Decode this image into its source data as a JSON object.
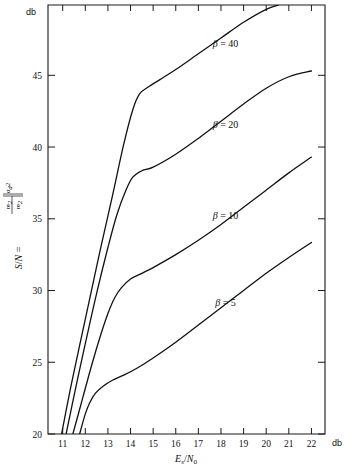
{
  "figure": {
    "x_unit_label": "db",
    "y_unit_label": "db",
    "x_axis_title_main": "E",
    "x_axis_title_sub1": "s",
    "x_axis_title_slash": "/",
    "x_axis_title_main2": "N",
    "x_axis_title_sub2": "0",
    "y_axis_title": "S/N = "
  },
  "chart_data": {
    "type": "line",
    "title": "",
    "xlabel": "E_s/N_0",
    "ylabel": "S/N",
    "x_unit": "db",
    "y_unit": "db",
    "xlim": [
      10.35,
      22.6
    ],
    "ylim": [
      20,
      49.9
    ],
    "xticks": [
      11,
      12,
      13,
      14,
      15,
      16,
      17,
      18,
      19,
      20,
      21,
      22
    ],
    "xtick_labels": [
      "11",
      "12",
      "13",
      "14",
      "15",
      "16",
      "17",
      "18",
      "19",
      "20",
      "21",
      "22"
    ],
    "yticks": [
      20,
      25,
      30,
      35,
      40,
      45
    ],
    "ytick_labels": [
      "20",
      "25",
      "30",
      "35",
      "40",
      "45"
    ],
    "grid": false,
    "legend_position": "inline-annotations",
    "series": [
      {
        "name": "beta = 5",
        "label": "β = 5",
        "label_x": 18.2,
        "label_y": 28.9,
        "points": [
          [
            11.75,
            20.0
          ],
          [
            12.0,
            21.4
          ],
          [
            12.2,
            22.2
          ],
          [
            12.45,
            22.85
          ],
          [
            12.8,
            23.35
          ],
          [
            13.2,
            23.75
          ],
          [
            13.7,
            24.1
          ],
          [
            14.3,
            24.6
          ],
          [
            15.0,
            25.3
          ],
          [
            16.0,
            26.4
          ],
          [
            17.0,
            27.6
          ],
          [
            18.0,
            28.8
          ],
          [
            19.0,
            30.0
          ],
          [
            20.0,
            31.2
          ],
          [
            21.0,
            32.3
          ],
          [
            22.0,
            33.35
          ]
        ]
      },
      {
        "name": "beta = 10",
        "label": "β = 10",
        "label_x": 18.2,
        "label_y": 35.0,
        "points": [
          [
            11.45,
            20.0
          ],
          [
            11.9,
            22.6
          ],
          [
            12.3,
            24.9
          ],
          [
            12.7,
            27.0
          ],
          [
            13.0,
            28.4
          ],
          [
            13.3,
            29.5
          ],
          [
            13.6,
            30.2
          ],
          [
            14.0,
            30.8
          ],
          [
            14.5,
            31.2
          ],
          [
            15.0,
            31.6
          ],
          [
            16.0,
            32.5
          ],
          [
            17.0,
            33.5
          ],
          [
            18.0,
            34.6
          ],
          [
            19.0,
            35.8
          ],
          [
            20.0,
            37.0
          ],
          [
            21.0,
            38.2
          ],
          [
            22.0,
            39.3
          ]
        ]
      },
      {
        "name": "beta = 20",
        "label": "β = 20",
        "label_x": 18.2,
        "label_y": 41.3,
        "points": [
          [
            11.15,
            20.0
          ],
          [
            11.6,
            23.4
          ],
          [
            12.0,
            26.3
          ],
          [
            12.5,
            29.8
          ],
          [
            13.0,
            33.0
          ],
          [
            13.4,
            35.3
          ],
          [
            13.8,
            37.0
          ],
          [
            14.1,
            37.9
          ],
          [
            14.5,
            38.35
          ],
          [
            15.0,
            38.6
          ],
          [
            16.0,
            39.5
          ],
          [
            17.0,
            40.6
          ],
          [
            18.0,
            41.8
          ],
          [
            19.0,
            43.0
          ],
          [
            20.0,
            44.1
          ],
          [
            21.0,
            44.9
          ],
          [
            22.0,
            45.3
          ]
        ]
      },
      {
        "name": "beta = 40",
        "label": "β = 40",
        "label_x": 18.2,
        "label_y": 47.0,
        "points": [
          [
            10.95,
            20.0
          ],
          [
            11.4,
            23.6
          ],
          [
            12.0,
            28.0
          ],
          [
            12.6,
            32.4
          ],
          [
            13.2,
            36.6
          ],
          [
            13.7,
            40.2
          ],
          [
            14.1,
            42.6
          ],
          [
            14.4,
            43.7
          ],
          [
            14.8,
            44.2
          ],
          [
            15.3,
            44.7
          ],
          [
            16.0,
            45.4
          ],
          [
            17.0,
            46.5
          ],
          [
            18.0,
            47.6
          ],
          [
            19.0,
            48.7
          ],
          [
            20.0,
            49.6
          ],
          [
            20.55,
            49.9
          ]
        ]
      }
    ]
  }
}
